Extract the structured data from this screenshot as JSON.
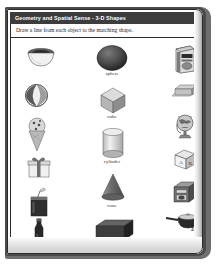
{
  "worksheet": {
    "header_title": "Geometry and Spatial Sense - 3-D Shapes",
    "instruction": "Draw a line from each object to the matching shape.",
    "page_number": "33",
    "header_bg": "#3c3c3c",
    "header_text_color": "#ffffff",
    "paper_bg": "#fdfdfd"
  },
  "center_shapes": [
    {
      "label": "sphere",
      "icon": "sphere-shape",
      "cx": 105,
      "cy": 52
    },
    {
      "label": "cube",
      "icon": "cube-shape",
      "cx": 105,
      "cy": 92
    },
    {
      "label": "cylinder",
      "icon": "cylinder-shape",
      "cx": 105,
      "cy": 136
    },
    {
      "label": "cone",
      "icon": "cone-shape",
      "cx": 105,
      "cy": 181
    },
    {
      "label": "rectangular prism",
      "icon": "rectangular-prism-shape",
      "cx": 105,
      "cy": 224
    }
  ],
  "left_objects": [
    {
      "name": "dog-bowl",
      "icon": "dog-bowl-icon",
      "cx": 33,
      "cy": 52
    },
    {
      "name": "beach-ball",
      "icon": "beach-ball-icon",
      "cx": 29,
      "cy": 87
    },
    {
      "name": "ice-cream-cone",
      "icon": "ice-cream-cone-icon",
      "cx": 29,
      "cy": 124
    },
    {
      "name": "gift-box",
      "icon": "gift-box-icon",
      "cx": 31,
      "cy": 158
    },
    {
      "name": "drink-cup",
      "icon": "drink-cup-icon",
      "cx": 31,
      "cy": 192
    },
    {
      "name": "bottle",
      "icon": "bottle-icon",
      "cx": 31,
      "cy": 226
    }
  ],
  "right_objects": [
    {
      "name": "cereal-box",
      "icon": "cereal-box-icon",
      "cx": 178,
      "cy": 50
    },
    {
      "name": "eraser-bar",
      "icon": "eraser-bar-icon",
      "cx": 178,
      "cy": 85
    },
    {
      "name": "globe",
      "icon": "globe-icon",
      "cx": 178,
      "cy": 117
    },
    {
      "name": "alphabet-block",
      "icon": "alphabet-block-icon",
      "cx": 178,
      "cy": 150
    },
    {
      "name": "beehive-oven",
      "icon": "beehive-oven-icon",
      "cx": 178,
      "cy": 184
    },
    {
      "name": "saucepan",
      "icon": "saucepan-icon",
      "cx": 178,
      "cy": 212
    },
    {
      "name": "roll-can",
      "icon": "roll-can-icon",
      "cx": 180,
      "cy": 238
    }
  ],
  "match_lines": [
    {
      "from": "dog-bowl",
      "to": "cylinder",
      "x1": 46,
      "y1": 58,
      "x2": 150,
      "y2": 155
    },
    {
      "from": "beach-ball",
      "to": "sphere",
      "x1": 42,
      "y1": 88,
      "x2": 160,
      "y2": 55
    },
    {
      "from": "ice-cream-cone",
      "to": "cone",
      "x1": 40,
      "y1": 128,
      "x2": 163,
      "y2": 185
    },
    {
      "from": "gift-box",
      "to": "cube",
      "x1": 44,
      "y1": 160,
      "x2": 158,
      "y2": 95
    },
    {
      "from": "drink-cup",
      "to": "cylinder",
      "x1": 44,
      "y1": 193,
      "x2": 166,
      "y2": 215
    },
    {
      "from": "bottle",
      "to": "rectangular-prism",
      "x1": 42,
      "y1": 228,
      "x2": 162,
      "y2": 122
    },
    {
      "from": "cereal-box",
      "to": "rectangular-prism",
      "x1": 166,
      "y1": 56,
      "x2": 58,
      "y2": 170
    },
    {
      "from": "eraser-bar",
      "to": "rectangular-prism",
      "x1": 164,
      "y1": 88,
      "x2": 62,
      "y2": 200
    },
    {
      "from": "globe",
      "to": "sphere",
      "x1": 164,
      "y1": 118,
      "x2": 50,
      "y2": 60
    },
    {
      "from": "alphabet-block",
      "to": "cube",
      "x1": 164,
      "y1": 150,
      "x2": 52,
      "y2": 95
    },
    {
      "from": "beehive-oven",
      "to": "cube",
      "x1": 164,
      "y1": 184,
      "x2": 56,
      "y2": 130
    },
    {
      "from": "saucepan",
      "to": "cylinder",
      "x1": 160,
      "y1": 212,
      "x2": 60,
      "y2": 128
    },
    {
      "from": "roll-can",
      "to": "cylinder",
      "x1": 168,
      "y1": 236,
      "x2": 64,
      "y2": 150
    }
  ]
}
